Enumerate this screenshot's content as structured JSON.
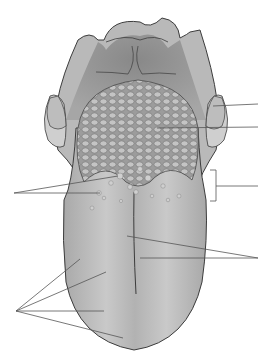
{
  "diagram": {
    "labels_visible": false,
    "colors": {
      "background": "#ffffff",
      "tongue_fill": "#b4b4b4",
      "tongue_highlight": "#cfcfcf",
      "pharynx_fill": "#9a9a9a",
      "tonsil_fill": "#c8c8c8",
      "outline": "#3c3c3c",
      "leader_line": "#555555",
      "papillae_fill": "#c6c6c6"
    },
    "leader_groups": [
      {
        "name": "palatine-tonsil",
        "side": "right",
        "end": [
          258,
          104
        ]
      },
      {
        "name": "lingual-tonsil",
        "side": "right",
        "end": [
          258,
          127
        ]
      },
      {
        "name": "vallate-papillae-fungiform",
        "side": "left",
        "end": [
          14,
          193
        ]
      },
      {
        "name": "sulcus-terminalis-bracket",
        "side": "right",
        "end": [
          258,
          186
        ]
      },
      {
        "name": "median-sulcus",
        "side": "right",
        "end": [
          258,
          258
        ]
      },
      {
        "name": "taste-regions",
        "side": "left",
        "end": [
          16,
          311
        ]
      }
    ]
  }
}
